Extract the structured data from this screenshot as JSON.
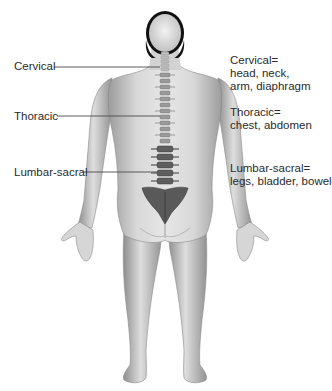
{
  "diagram": {
    "type": "anatomical-illustration",
    "labels": [
      {
        "id": "cervical",
        "text": "Cervical"
      },
      {
        "id": "thoracic",
        "text": "Thoracic"
      },
      {
        "id": "lumbar_sacral",
        "text": "Lumbar-sacral"
      }
    ],
    "descriptions": [
      {
        "id": "cervical",
        "title": "Cervical=",
        "lines": [
          "head, neck,",
          "arm, diaphragm"
        ]
      },
      {
        "id": "thoracic",
        "title": "Thoracic=",
        "lines": [
          "chest, abdomen"
        ]
      },
      {
        "id": "lumbar_sacral",
        "title": "Lumbar-sacral=",
        "lines": [
          "legs, bladder, bowel"
        ]
      }
    ],
    "colors": {
      "skin_light": "#e4e4e4",
      "skin_shade": "#9a9a9a",
      "spine_dark": "#555555",
      "hair": "#111111",
      "leader_line": "#4a4a4a"
    }
  }
}
